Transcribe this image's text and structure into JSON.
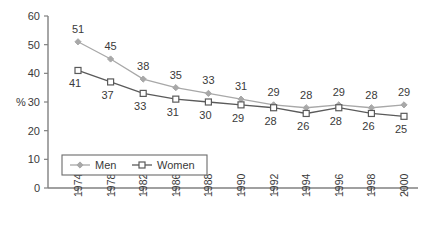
{
  "chart_data": {
    "type": "line",
    "title": "",
    "subtitle": "",
    "xlabel": "",
    "ylabel": "%",
    "categories": [
      "1974",
      "1978",
      "1982",
      "1986",
      "1988",
      "1990",
      "1992",
      "1994",
      "1996",
      "1998",
      "2000"
    ],
    "series": [
      {
        "name": "Men",
        "marker": "diamond",
        "color": "#a8a8a8",
        "label_position": "above",
        "values": [
          51,
          45,
          38,
          35,
          33,
          31,
          29,
          28,
          29,
          28,
          29
        ]
      },
      {
        "name": "Women",
        "marker": "square-open",
        "color": "#5a5a5a",
        "label_position": "below",
        "values": [
          41,
          37,
          33,
          31,
          30,
          29,
          28,
          26,
          28,
          26,
          25
        ]
      }
    ],
    "ylim": [
      0,
      60
    ],
    "yticks": [
      "0",
      "10",
      "20",
      "30",
      "40",
      "50",
      "60"
    ],
    "grid": false,
    "legend_position": "bottom-left",
    "axis_color": "#808080"
  },
  "legend": {
    "items": [
      {
        "label": "Men",
        "marker": "diamond-marker-icon"
      },
      {
        "label": "Women",
        "marker": "square-marker-icon"
      }
    ]
  }
}
